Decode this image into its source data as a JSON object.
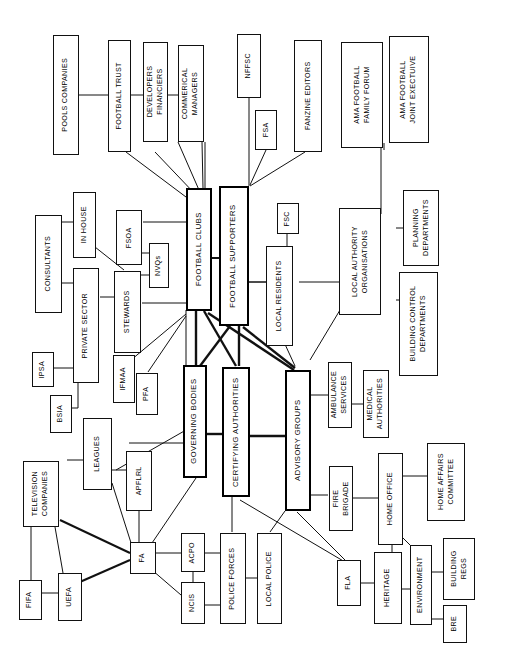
{
  "diagram": {
    "orientation": "text rotated 90 degrees counter-clockwise",
    "core_nodes": [
      {
        "id": "football_clubs",
        "label": "FOOTBALL CLUBS"
      },
      {
        "id": "football_supporters",
        "label": "FOOTBALL SUPPORTERS"
      },
      {
        "id": "governing_bodies",
        "label": "GOVERNING BODIES"
      },
      {
        "id": "certifying_authorities",
        "label": "CERTIFYING AUTHORITIES"
      },
      {
        "id": "advisory_groups",
        "label": "ADVISORY GROUPS"
      }
    ],
    "nodes": [
      {
        "id": "pools_companies",
        "label": "POOLS COMPANIES"
      },
      {
        "id": "football_trust",
        "label": "FOOTBALL TRUST"
      },
      {
        "id": "developers_financiers",
        "label": "DEVELOPERS",
        "label2": "FINANCIERS"
      },
      {
        "id": "commerical_managers",
        "label": "COMMERICAL",
        "label2": "MANAGERS"
      },
      {
        "id": "nffsc",
        "label": "NFFSC"
      },
      {
        "id": "fsa",
        "label": "FSA"
      },
      {
        "id": "fanzine_editors",
        "label": "FANZINE EDITORS"
      },
      {
        "id": "ama_family_forum",
        "label": "AMA FOOTBALL",
        "label2": "FAMILY FORUM"
      },
      {
        "id": "ama_joint_exec",
        "label": "AMA FOOTBALL",
        "label2": "JOINT EXECTUIVE"
      },
      {
        "id": "consultants",
        "label": "CONSULTANTS"
      },
      {
        "id": "in_house",
        "label": "IN HOUSE"
      },
      {
        "id": "fsoa",
        "label": "FSOA"
      },
      {
        "id": "nvqs",
        "label": "NVQs"
      },
      {
        "id": "private_sector",
        "label": "PRIVATE SECTOR"
      },
      {
        "id": "stewards",
        "label": "STEWARDS"
      },
      {
        "id": "fsc",
        "label": "FSC"
      },
      {
        "id": "local_residents",
        "label": "LOCAL RESIDENTS"
      },
      {
        "id": "local_authority_orgs",
        "label": "LOCAL AUTHORITY",
        "label2": "ORGANISATIONS"
      },
      {
        "id": "planning_departments",
        "label": "PLANNING",
        "label2": "DEPARTMENTS"
      },
      {
        "id": "building_control",
        "label": "BUILDING CONTROL",
        "label2": "DEPARTMENTS"
      },
      {
        "id": "ipsa",
        "label": "IPSA"
      },
      {
        "id": "bsia",
        "label": "BSIA"
      },
      {
        "id": "ifmaa",
        "label": "IFMAA"
      },
      {
        "id": "pfa",
        "label": "PFA"
      },
      {
        "id": "ambulance_services",
        "label": "AMBULANCE",
        "label2": "SERVICES"
      },
      {
        "id": "medical_authorities",
        "label": "MEDICAL",
        "label2": "AUTHORITIES"
      },
      {
        "id": "leagues",
        "label": "LEAGUES"
      },
      {
        "id": "apflrl",
        "label": "APFLRL"
      },
      {
        "id": "television_companies",
        "label": "TELEVISION",
        "label2": "COMPANIES"
      },
      {
        "id": "fifa",
        "label": "FIFA"
      },
      {
        "id": "uefa",
        "label": "UEFA"
      },
      {
        "id": "fa",
        "label": "FA"
      },
      {
        "id": "acpo",
        "label": "ACPO"
      },
      {
        "id": "ncis",
        "label": "NCIS"
      },
      {
        "id": "police_forces",
        "label": "POLICE FORCES"
      },
      {
        "id": "local_police",
        "label": "LOCAL POLICE"
      },
      {
        "id": "fire_brigade",
        "label": "FIRE",
        "label2": "BRIGADE"
      },
      {
        "id": "home_office",
        "label": "HOME OFFICE"
      },
      {
        "id": "home_affairs",
        "label": "HOME AFFAIRS",
        "label2": "COMMITTEE"
      },
      {
        "id": "fla",
        "label": "FLA"
      },
      {
        "id": "heritage",
        "label": "HERITAGE"
      },
      {
        "id": "environment",
        "label": "ENVIRONMENT"
      },
      {
        "id": "building_regs",
        "label": "BUILDING",
        "label2": "REGS"
      },
      {
        "id": "bre",
        "label": "BRE"
      }
    ]
  }
}
